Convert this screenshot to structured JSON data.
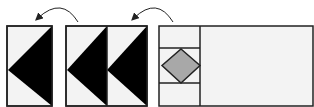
{
  "diagram": {
    "colors": {
      "background": "#ffffff",
      "panel_fill": "#f3f3f3",
      "dark_fabric": "#000000",
      "diamond_fill": "#a8a8a8",
      "outline": "#222222"
    },
    "panels": [
      {
        "id": "single-goose",
        "x": 7,
        "y": 26,
        "w": 45,
        "h": 80,
        "apex_y": 70
      },
      {
        "id": "double-goose",
        "x": 66,
        "y": 26,
        "w": 81,
        "h": 80,
        "divider_x": 107,
        "apex_y": 70
      },
      {
        "id": "square-in-square-assembly",
        "x": 159,
        "y": 26,
        "w": 154,
        "h": 80,
        "divider_x": 200,
        "hlines_y": [
          48,
          83
        ]
      }
    ],
    "arrows": [
      {
        "id": "arrow-1",
        "from": [
          78,
          22
        ],
        "to": [
          37,
          20
        ]
      },
      {
        "id": "arrow-2",
        "from": [
          173,
          22
        ],
        "to": [
          133,
          20
        ]
      }
    ]
  }
}
